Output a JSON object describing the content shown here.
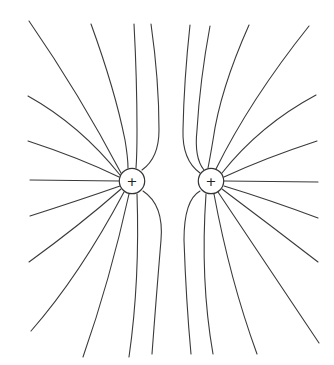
{
  "diagram": {
    "charges": [
      {
        "id": "left",
        "sign": "+",
        "cx": 132,
        "cy": 181,
        "r": 12.7
      },
      {
        "id": "right",
        "sign": "+",
        "cx": 211,
        "cy": 181,
        "r": 12.7
      }
    ],
    "colors": {
      "line": "#3a3a3a",
      "background": "#ffffff"
    },
    "field_lines_per_charge": 13
  }
}
